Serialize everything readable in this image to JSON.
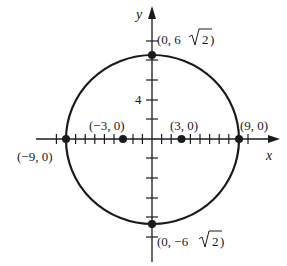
{
  "diagram": {
    "type": "ellipse-on-axes",
    "axes": {
      "x_label": "x",
      "y_label": "y",
      "y_tick_label": "4",
      "tick_step": 2
    },
    "curve": {
      "center": [
        0,
        0
      ],
      "semi_major_x": 9,
      "semi_minor_y": "6√2"
    },
    "points": [
      {
        "name": "vertex-left",
        "label": "(−9, 0)"
      },
      {
        "name": "vertex-right",
        "label": "(9, 0)"
      },
      {
        "name": "focus-left",
        "label": "(−3, 0)"
      },
      {
        "name": "focus-right",
        "label": "(3, 0)"
      },
      {
        "name": "covertex-top",
        "label_prefix": "(0, 6",
        "label_root": "2",
        "label_suffix": ")"
      },
      {
        "name": "covertex-bottom",
        "label_prefix": "(0, −6",
        "label_root": "2",
        "label_suffix": ")"
      }
    ],
    "colors": {
      "ink": "#1a1a1a",
      "background": "#ffffff"
    }
  }
}
